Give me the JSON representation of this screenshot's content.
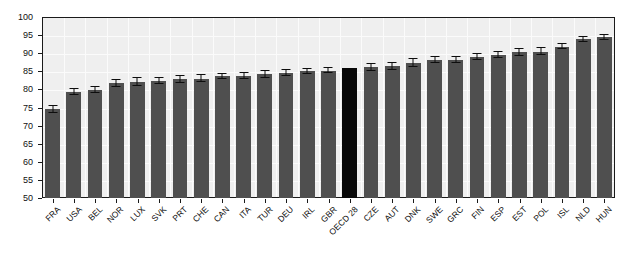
{
  "chart_data": {
    "type": "bar",
    "title": "",
    "subtitle": "",
    "xlabel": "",
    "ylabel": "",
    "ylim": [
      50,
      100
    ],
    "ytick_step": 5,
    "yticks": [
      50,
      55,
      60,
      65,
      70,
      75,
      80,
      85,
      90,
      95,
      100
    ],
    "grid": true,
    "legend": "none",
    "orientation": "vertical",
    "error_bars": true,
    "bar_color": "#4f4f4f",
    "highlight_color": "#080808",
    "plot_background": "#efefef",
    "gridline_color": "#fbfbfb",
    "axis_color": "#1a1a1a",
    "highlight_category": "OECD 28",
    "categories": [
      "FRA",
      "USA",
      "BEL",
      "NOR",
      "LUX",
      "SVK",
      "PRT",
      "CHE",
      "CAN",
      "ITA",
      "TUR",
      "DEU",
      "IRL",
      "GBR",
      "OECD 28",
      "CZE",
      "AUT",
      "DNK",
      "SWE",
      "GRC",
      "FIN",
      "ESP",
      "EST",
      "POL",
      "ISL",
      "NLD",
      "HUN"
    ],
    "values": [
      74.5,
      79.2,
      79.9,
      81.7,
      82.1,
      82.4,
      82.8,
      83.0,
      83.6,
      83.7,
      84.2,
      84.6,
      85.0,
      85.2,
      85.8,
      86.1,
      86.4,
      87.3,
      88.1,
      88.2,
      89.0,
      89.5,
      90.2,
      90.4,
      91.8,
      93.8,
      94.4
    ],
    "errors": [
      1.2,
      1.1,
      1.0,
      1.3,
      1.4,
      1.0,
      1.3,
      1.2,
      1.0,
      1.2,
      1.2,
      1.0,
      0.9,
      0.9,
      0.0,
      1.2,
      1.2,
      1.3,
      1.0,
      0.9,
      1.0,
      1.0,
      1.2,
      1.2,
      0.9,
      0.9,
      0.9
    ]
  }
}
